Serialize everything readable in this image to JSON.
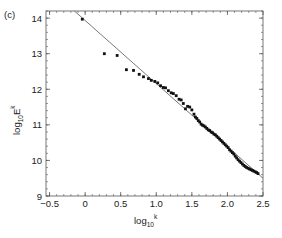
{
  "chart_data": {
    "type": "scatter",
    "panel_label": "(c)",
    "title": "",
    "xlabel": "log10k",
    "ylabel": "log10Ek",
    "xlabel_parts": {
      "base": "log",
      "sub": "10",
      "sup": "k"
    },
    "ylabel_parts": {
      "base": "log",
      "sub": "10",
      "main": "E",
      "sup": "k"
    },
    "xlim": [
      -0.55,
      2.5
    ],
    "ylim": [
      9.0,
      14.2
    ],
    "xticks": [
      -0.5,
      0,
      0.5,
      1.0,
      1.5,
      2.0,
      2.5
    ],
    "xtick_labels": [
      "−0.5",
      "0",
      "0.5",
      "1.0",
      "1.5",
      "2.0",
      "2.5"
    ],
    "yticks": [
      9,
      10,
      11,
      12,
      13,
      14
    ],
    "ytick_labels": [
      "9",
      "10",
      "11",
      "12",
      "13",
      "14"
    ],
    "grid": false,
    "legend": null,
    "colors": {
      "points": "#111111",
      "fit_line": "#555555",
      "frame": "#555555"
    },
    "series": [
      {
        "name": "spectrum",
        "kind": "points",
        "x": [
          -0.04,
          0.27,
          0.45,
          0.58,
          0.68,
          0.76,
          0.82,
          0.89,
          0.93,
          0.98,
          1.02,
          1.06,
          1.1,
          1.13,
          1.17,
          1.21,
          1.24,
          1.28,
          1.32,
          1.35,
          1.38,
          1.41,
          1.44,
          1.47,
          1.5,
          1.53,
          1.55,
          1.57,
          1.59,
          1.61,
          1.63,
          1.65,
          1.67,
          1.69,
          1.71,
          1.73,
          1.75,
          1.77,
          1.79,
          1.81,
          1.83,
          1.85,
          1.87,
          1.89,
          1.91,
          1.93,
          1.95,
          1.97,
          1.99,
          2.01,
          2.03,
          2.05,
          2.07,
          2.09,
          2.11,
          2.13,
          2.15,
          2.17,
          2.19,
          2.21,
          2.23,
          2.25,
          2.27,
          2.29,
          2.31,
          2.33,
          2.35,
          2.37,
          2.39,
          2.41,
          2.43
        ],
        "y": [
          13.97,
          13.0,
          12.95,
          12.55,
          12.53,
          12.42,
          12.35,
          12.3,
          12.25,
          12.22,
          12.18,
          12.1,
          12.05,
          12.04,
          11.96,
          11.9,
          11.88,
          11.82,
          11.72,
          11.7,
          11.6,
          11.45,
          11.52,
          11.5,
          11.42,
          11.3,
          11.22,
          11.18,
          11.12,
          11.08,
          11.02,
          10.99,
          10.97,
          10.94,
          10.9,
          10.86,
          10.84,
          10.8,
          10.78,
          10.74,
          10.72,
          10.68,
          10.64,
          10.6,
          10.56,
          10.52,
          10.48,
          10.44,
          10.4,
          10.36,
          10.3,
          10.26,
          10.22,
          10.18,
          10.12,
          10.07,
          10.02,
          9.98,
          9.94,
          9.9,
          9.86,
          9.83,
          9.8,
          9.78,
          9.76,
          9.74,
          9.72,
          9.7,
          9.68,
          9.66,
          9.63
        ]
      },
      {
        "name": "power-law fit",
        "kind": "line",
        "x": [
          -0.15,
          2.5
        ],
        "y": [
          14.2,
          9.5
        ]
      }
    ]
  }
}
